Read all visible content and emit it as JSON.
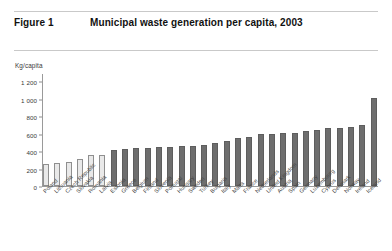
{
  "figure": {
    "number_label": "Figure 1",
    "title": "Municipal waste generation per capita, 2003"
  },
  "chart_data": {
    "type": "bar",
    "title": "Municipal waste generation per capita, 2003",
    "xlabel": "",
    "ylabel": "Kg/capita",
    "unit_label": "Kg/capita",
    "ylim": [
      0,
      1200
    ],
    "yticks": [
      0,
      200,
      400,
      600,
      800,
      1000,
      1200
    ],
    "ytick_labels": [
      "0",
      "200",
      "400",
      "600",
      "800",
      "1 000",
      "1 200"
    ],
    "grid": false,
    "legend": "none",
    "series_colors": {
      "light_bar": "#e9e9e9",
      "dark_bar": "#6e6e6e",
      "bar_border": "#8f8f8f",
      "axis": "#9a9a9a",
      "text": "#3a3a3a"
    },
    "categories": [
      "Poland",
      "Lithuania",
      "Czech Republic",
      "Slovakia",
      "Romania",
      "Latvia",
      "Estonia",
      "Greece",
      "Belgium",
      "Finland",
      "Slovenia",
      "Portugal",
      "Hungary",
      "Sweden",
      "Turkey",
      "Bulgaria",
      "Italy",
      "Malta",
      "France",
      "Netherlands",
      "United Kingdom",
      "Austria",
      "Spain",
      "Germany",
      "Luxembourg",
      "Cyprus",
      "Denmark",
      "Norway",
      "Ireland",
      "Iceland"
    ],
    "values": [
      255,
      260,
      280,
      305,
      350,
      360,
      410,
      425,
      435,
      435,
      445,
      450,
      455,
      460,
      470,
      495,
      515,
      545,
      560,
      590,
      600,
      605,
      610,
      625,
      640,
      660,
      665,
      675,
      700,
      1010
    ],
    "shades": [
      "light",
      "light",
      "light",
      "light",
      "light",
      "light",
      "dark",
      "dark",
      "dark",
      "dark",
      "dark",
      "dark",
      "dark",
      "dark",
      "dark",
      "dark",
      "dark",
      "dark",
      "dark",
      "dark",
      "dark",
      "dark",
      "dark",
      "dark",
      "dark",
      "dark",
      "dark",
      "dark",
      "dark",
      "dark"
    ]
  }
}
